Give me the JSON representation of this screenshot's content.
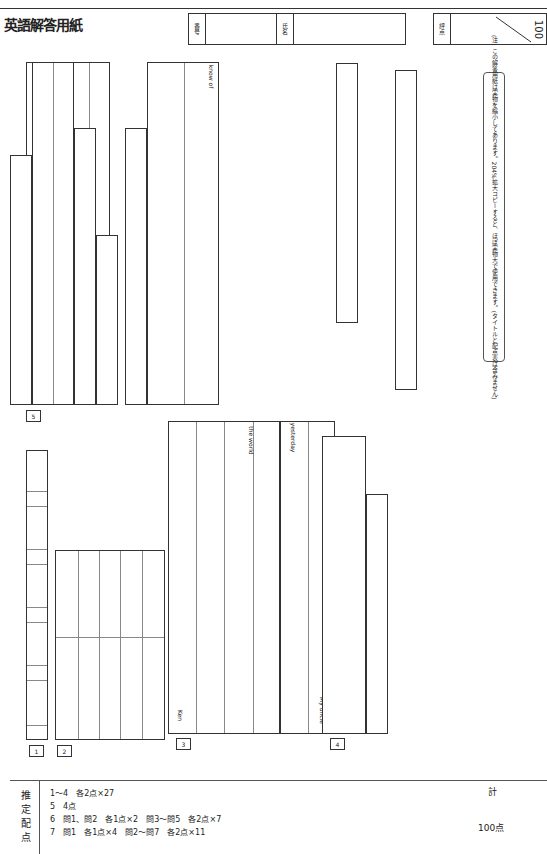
{
  "header": {
    "title": "英語解答用紙",
    "number_label": "番号",
    "name_label": "氏名",
    "score_label": "評点",
    "score_max": "100"
  },
  "note": "(注) この解答用紙は実物を縮小してあります。204%拡大コピーすると、ほぼ実物大で使用できます。(タイトルと配点表は含みません)",
  "sections": {
    "s1": {
      "label": "1",
      "items": [
        "1",
        "2",
        "3",
        "4",
        "5"
      ]
    },
    "s2": {
      "label": "2",
      "items": [
        "1",
        "2",
        "3",
        "4",
        "5"
      ]
    },
    "s3": {
      "label": "3",
      "items": [
        "1",
        "2",
        "3",
        "4",
        "5"
      ],
      "prefills": {
        "1": "Ken",
        "3": "the world",
        "4": "yesterday",
        "5": "My uncle"
      }
    },
    "s4": {
      "label": "4",
      "row_a": "A",
      "row_b": "B",
      "a_top": [
        "1",
        "2",
        "3",
        "4",
        "5"
      ],
      "a_bottom": [
        "6",
        "7",
        "8"
      ],
      "b_items": [
        "1",
        "2",
        "3",
        "4"
      ]
    },
    "s5": {
      "label": "5"
    },
    "s6": {
      "label": "6",
      "q1": "問1",
      "q2": "問2",
      "q3": "問3",
      "q3_items": [
        "1",
        "2"
      ],
      "q4": "問4",
      "q4_items": [
        "1",
        "2",
        "3",
        "4"
      ],
      "q5": "問5",
      "q5_kigou": "記号",
      "q5_go": "語"
    },
    "s7": {
      "label": "7",
      "q1": "問1",
      "q1_items": [
        "1",
        "2",
        "3",
        "4"
      ],
      "q2": "問2",
      "q2_prefill": "This is",
      "q2_suffix": "know of",
      "q3": "問3",
      "q4": "問4",
      "q5": "問5",
      "q6": "問6",
      "q7": "問7",
      "q7_items": [
        "1",
        "2",
        "3",
        "4",
        "5",
        "6"
      ]
    }
  },
  "scoring": {
    "title": "推定配点",
    "lines": [
      "1～4　各2点×27",
      "5　4点",
      "6　問1、問2　各1点×2　問3～問5　各2点×7",
      "7　問1　各1点×4　問2～問7　各2点×11"
    ],
    "total_label": "計",
    "total_value": "100点"
  }
}
